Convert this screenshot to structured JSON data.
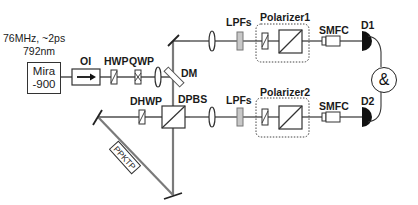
{
  "diagram": {
    "type": "optical-setup",
    "colors": {
      "beam": "#7a7a7a",
      "stroke": "#333333",
      "lpf_fill": "#c8c8c8",
      "detector": "#111111"
    },
    "source": {
      "name_line1": "Mira",
      "name_line2": "-900",
      "spec_line1": "76MHz, ~2ps",
      "spec_line2": "792nm"
    },
    "labels": {
      "oi": "OI",
      "hwp": "HWP",
      "qwp": "QWP",
      "dm": "DM",
      "dhwp": "DHWP",
      "dpbs": "DPBS",
      "ppktp": "PPKTP",
      "lpfs_top": "LPFs",
      "lpfs_bottom": "LPFs",
      "polarizer1": "Polarizer1",
      "polarizer2": "Polarizer2",
      "smfc_top": "SMFC",
      "smfc_bottom": "SMFC",
      "d1": "D1",
      "d2": "D2",
      "coincidence": "&"
    }
  }
}
